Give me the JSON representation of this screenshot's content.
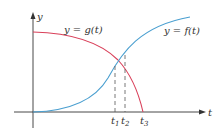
{
  "diagram": {
    "axes": {
      "x_label": "t",
      "y_label": "y"
    },
    "curves": [
      {
        "name": "g",
        "label": "y = g(t)",
        "color": "#d9405a",
        "description": "decreasing, concave down, reaches zero at t3"
      },
      {
        "name": "f",
        "label": "y = f(t)",
        "color": "#4a9fd0",
        "description": "increasing S-shaped curve"
      }
    ],
    "ticks": [
      {
        "base": "t",
        "sub": "1"
      },
      {
        "base": "t",
        "sub": "2"
      },
      {
        "base": "t",
        "sub": "3"
      }
    ],
    "annotations": {
      "dashed_lines": [
        "t1",
        "t2"
      ],
      "intersection_at": "t1"
    },
    "colors": {
      "axis": "#333333",
      "dashed": "#555555",
      "g_curve": "#d9405a",
      "f_curve": "#4a9fd0"
    }
  }
}
